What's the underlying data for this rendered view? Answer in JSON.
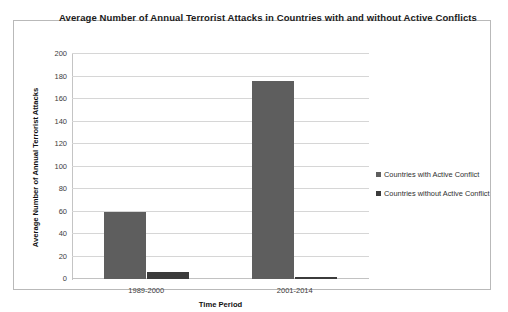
{
  "chart_data": {
    "type": "bar",
    "title": "Average Number of Annual Terrorist Attacks in Countries with and without Active Conflicts",
    "xlabel": "Time Period",
    "ylabel": "Average Number of Annual Terrorist Attacks",
    "categories": [
      "1989-2000",
      "2001-2014"
    ],
    "series": [
      {
        "name": "Countries with Active Conflict",
        "values": [
          60,
          176
        ],
        "color": "#5e5e5e"
      },
      {
        "name": "Countries without Active Conflict",
        "values": [
          6,
          2
        ],
        "color": "#3b3b3b"
      }
    ],
    "ylim": [
      0,
      200
    ],
    "yticks": [
      0,
      20,
      40,
      60,
      80,
      100,
      120,
      140,
      160,
      180,
      200
    ],
    "ytick_labels": [
      "0",
      "20",
      "40",
      "60",
      "80",
      "100",
      "120",
      "140",
      "160",
      "180",
      "200"
    ],
    "grid": true,
    "legend_position": "right",
    "plot_border": true
  }
}
